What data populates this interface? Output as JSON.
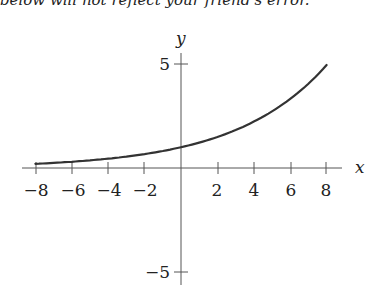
{
  "top_text": "below will not reflect your friend's error.",
  "chart_data": {
    "type": "line",
    "title": "",
    "xlabel": "x",
    "ylabel": "y",
    "xlim": [
      -9,
      9.5
    ],
    "ylim": [
      -5.5,
      6
    ],
    "x_ticks": [
      -8,
      -6,
      -4,
      -2,
      2,
      4,
      6,
      8
    ],
    "x_tick_labels": [
      "−8",
      "−6",
      "−4",
      "−2",
      "2",
      "4",
      "6",
      "8"
    ],
    "y_ticks": [
      5,
      -5
    ],
    "y_tick_labels": [
      "5",
      "−5"
    ],
    "grid": false,
    "legend": null,
    "series": [
      {
        "name": "y = e^(x/5)",
        "x": [
          -8,
          -6,
          -4,
          -2,
          0,
          2,
          4,
          6,
          8
        ],
        "y": [
          0.2,
          0.3,
          0.45,
          0.67,
          1.0,
          1.49,
          2.23,
          3.32,
          4.95
        ]
      }
    ]
  }
}
